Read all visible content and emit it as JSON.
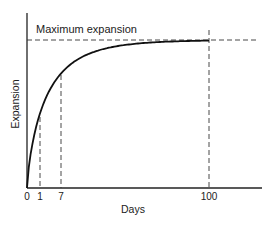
{
  "chart_data": {
    "type": "line",
    "title": "",
    "xlabel": "Days",
    "ylabel": "Expansion",
    "x_ticks": [
      "0",
      "1",
      "7",
      "100"
    ],
    "x_tick_values": [
      0,
      1,
      7,
      100
    ],
    "annotation": "Maximum expansion",
    "reference_lines": [
      {
        "orientation": "vertical",
        "x": 1,
        "style": "dashed"
      },
      {
        "orientation": "vertical",
        "x": 7,
        "style": "dashed"
      },
      {
        "orientation": "vertical",
        "x": 100,
        "style": "dashed"
      },
      {
        "orientation": "horizontal",
        "y": 1.0,
        "label": "Maximum expansion",
        "style": "dashed"
      }
    ],
    "series": [
      {
        "name": "Expansion",
        "description": "Expansion rises rapidly at first and approaches the maximum asymptotically, reaching it at about 100 days",
        "points": [
          {
            "x": 0,
            "y": 0.0
          },
          {
            "x": 1,
            "y": 0.37
          },
          {
            "x": 7,
            "y": 0.63
          },
          {
            "x": 100,
            "y": 1.0
          }
        ]
      }
    ],
    "grid": false,
    "legend": "none",
    "x_scale": "nonlinear (illustrative)",
    "y_units": "fraction of maximum expansion"
  }
}
